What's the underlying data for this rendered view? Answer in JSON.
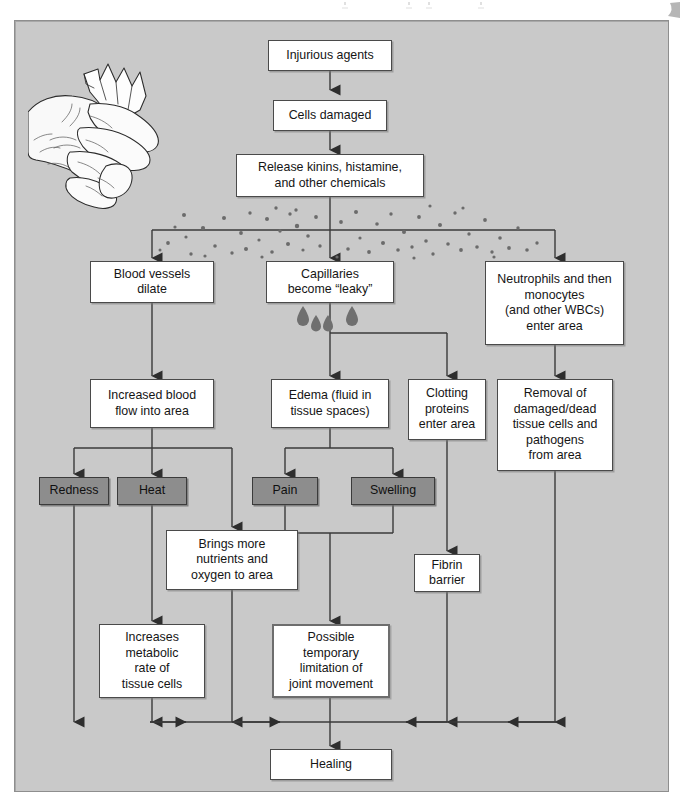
{
  "figure": {
    "background_color": "#c9c9c9",
    "box_fill": "#ffffff",
    "sign_box_fill": "#8d8d8d",
    "line_color": "#3a3a3a"
  },
  "illustration": {
    "name": "hand-with-glass-shard",
    "description": "Line drawing of a hand injured by a shard of glass"
  },
  "diffusion": {
    "name": "chemical-dot-field",
    "description": "Scattered dots representing kinins, histamine and other chemicals diffusing into tissue"
  },
  "droplets": {
    "name": "fluid-droplets",
    "count": 4,
    "description": "Teardrops of fluid leaking from capillaries"
  },
  "nodes": {
    "injurious_agents": "Injurious agents",
    "cells_damaged": "Cells damaged",
    "release_chemicals": "Release kinins, histamine,\nand other chemicals",
    "blood_vessels_dilate": "Blood vessels\ndilate",
    "capillaries_leaky": "Capillaries\nbecome “leaky”",
    "neutrophils": "Neutrophils and then\nmonocytes\n(and other WBCs)\nenter area",
    "increased_blood_flow": "Increased blood\nflow into area",
    "edema": "Edema (fluid in\ntissue spaces)",
    "clotting_proteins": "Clotting\nproteins\nenter area",
    "removal": "Removal of\ndamaged/dead\ntissue cells and\npathogens\nfrom area",
    "redness": "Redness",
    "heat": "Heat",
    "pain": "Pain",
    "swelling": "Swelling",
    "brings_nutrients": "Brings more\nnutrients and\noxygen to area",
    "fibrin_barrier": "Fibrin\nbarrier",
    "increases_metabolic": "Increases\nmetabolic\nrate of\ntissue cells",
    "joint_limitation": "Possible\ntemporary\nlimitation of\njoint movement",
    "healing": "Healing"
  }
}
